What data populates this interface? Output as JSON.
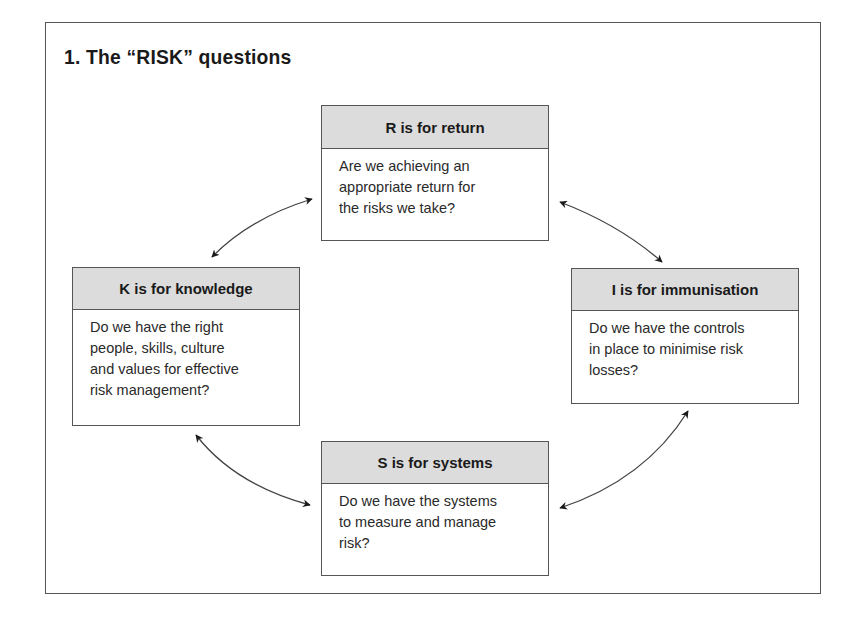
{
  "title": "1. The “RISK” questions",
  "boxes": {
    "r": {
      "header": "R is for return",
      "lines": [
        "Are we achieving an",
        "appropriate return for",
        "the risks we take?"
      ]
    },
    "k": {
      "header": "K is for knowledge",
      "lines": [
        "Do we have the right",
        "people, skills, culture",
        "and values for effective",
        "risk management?"
      ]
    },
    "i": {
      "header": "I is for immunisation",
      "lines": [
        "Do we have the controls",
        "in place to minimise risk",
        "losses?"
      ]
    },
    "s": {
      "header": "S is for systems",
      "lines": [
        "Do we have the systems",
        "to measure and manage",
        "risk?"
      ]
    }
  },
  "connectors": [
    {
      "from": "k",
      "to": "r",
      "type": "bidirectional-arrow"
    },
    {
      "from": "r",
      "to": "i",
      "type": "bidirectional-arrow"
    },
    {
      "from": "k",
      "to": "s",
      "type": "bidirectional-arrow"
    },
    {
      "from": "s",
      "to": "i",
      "type": "bidirectional-arrow"
    }
  ],
  "colors": {
    "header_fill": "#dcdcdc",
    "border": "#555555",
    "text": "#1a1a1a"
  }
}
